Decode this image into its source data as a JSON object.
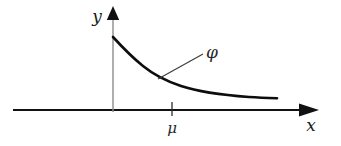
{
  "figure": {
    "title": "",
    "background_color": "#ffffff",
    "width": 341,
    "height": 146
  },
  "axes": {
    "x_axis": {
      "label": "x",
      "label_x": 311,
      "label_y": 131,
      "line_y": 110,
      "line_x_start": 13,
      "line_x_end": 300,
      "color": "#111111",
      "stroke_width": 2.2,
      "arrow": "right-arrowhead",
      "arrow_tip_x": 318
    },
    "y_axis": {
      "label": "y",
      "label_x": 97,
      "label_y": 22,
      "line_x": 113,
      "line_y_start": 16,
      "line_y_end": 112,
      "color": "#8c8c8c",
      "stroke_width": 1.4,
      "arrow": "up-arrowhead",
      "arrow_tip_y": 7
    }
  },
  "ticks": [
    {
      "label": "μ",
      "x": 172,
      "label_x": 172,
      "label_y": 130,
      "tick_top_y": 102,
      "tick_bottom_y": 116,
      "color": "#2b2b2b"
    }
  ],
  "curve": {
    "label": "φ",
    "label_x": 212,
    "label_y": 58,
    "color": "#0d0d0d",
    "stroke_width": 2.6,
    "shape": "exponential-decay",
    "start_point": [
      113,
      37
    ],
    "end_point": [
      277,
      98
    ],
    "points": [
      [
        113,
        37
      ],
      [
        122,
        45
      ],
      [
        132,
        54
      ],
      [
        142,
        63
      ],
      [
        152,
        70
      ],
      [
        162,
        76
      ],
      [
        172,
        81
      ],
      [
        185,
        86
      ],
      [
        198,
        90
      ],
      [
        212,
        92
      ],
      [
        228,
        94
      ],
      [
        245,
        96
      ],
      [
        261,
        97
      ],
      [
        277,
        98
      ]
    ]
  },
  "leader_line": {
    "from": [
      158,
      79
    ],
    "to": [
      203,
      54
    ],
    "color": "#3d3d3d",
    "stroke_width": 1.2
  }
}
